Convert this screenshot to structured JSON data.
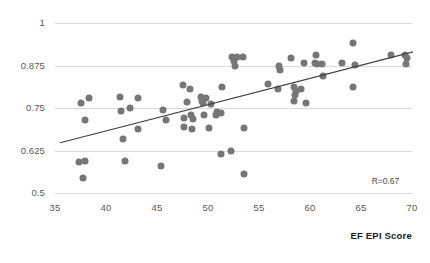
{
  "chart_data": {
    "type": "scatter",
    "title": "",
    "xlabel": "EF EPI Score",
    "ylabel": "",
    "xlim": [
      35,
      70
    ],
    "ylim": [
      0.5,
      1
    ],
    "xticks": [
      35,
      40,
      45,
      50,
      55,
      60,
      65,
      70
    ],
    "xtick_labels": [
      "35",
      "40",
      "45",
      "50",
      "55",
      "60",
      "65",
      "70"
    ],
    "yticks": [
      0.5,
      0.625,
      0.75,
      0.875,
      1
    ],
    "ytick_labels": [
      "0.5",
      "0.625",
      "0.75",
      "0.875",
      "1"
    ],
    "grid": "horizontal",
    "legend": "none",
    "annotations": [
      {
        "text": "R=0.67",
        "x": 68.2,
        "y": 0.533
      }
    ],
    "point_color": "#767676",
    "gridline_color": "#d9d9d9",
    "trend_line": {
      "color": "#404040",
      "x_start": 35.5,
      "y_start": 0.648,
      "x_end": 70.1,
      "y_end": 0.915
    },
    "points": [
      {
        "x": 37.5,
        "y": 0.766
      },
      {
        "x": 38.3,
        "y": 0.78
      },
      {
        "x": 37.9,
        "y": 0.714
      },
      {
        "x": 37.4,
        "y": 0.592
      },
      {
        "x": 37.9,
        "y": 0.594
      },
      {
        "x": 37.7,
        "y": 0.545
      },
      {
        "x": 41.4,
        "y": 0.782
      },
      {
        "x": 41.5,
        "y": 0.74
      },
      {
        "x": 42.4,
        "y": 0.75
      },
      {
        "x": 43.1,
        "y": 0.78
      },
      {
        "x": 43.1,
        "y": 0.688
      },
      {
        "x": 41.7,
        "y": 0.658
      },
      {
        "x": 41.9,
        "y": 0.594
      },
      {
        "x": 45.6,
        "y": 0.744
      },
      {
        "x": 45.9,
        "y": 0.716
      },
      {
        "x": 45.4,
        "y": 0.58
      },
      {
        "x": 47.5,
        "y": 0.818
      },
      {
        "x": 48.2,
        "y": 0.805
      },
      {
        "x": 47.9,
        "y": 0.768
      },
      {
        "x": 47.6,
        "y": 0.722
      },
      {
        "x": 47.6,
        "y": 0.694
      },
      {
        "x": 48.3,
        "y": 0.728
      },
      {
        "x": 48.5,
        "y": 0.718
      },
      {
        "x": 48.4,
        "y": 0.688
      },
      {
        "x": 49.3,
        "y": 0.782
      },
      {
        "x": 49.4,
        "y": 0.772
      },
      {
        "x": 49.5,
        "y": 0.765
      },
      {
        "x": 49.8,
        "y": 0.779
      },
      {
        "x": 49.6,
        "y": 0.728
      },
      {
        "x": 50.1,
        "y": 0.691
      },
      {
        "x": 50.3,
        "y": 0.762
      },
      {
        "x": 50.9,
        "y": 0.738
      },
      {
        "x": 51.3,
        "y": 0.735
      },
      {
        "x": 50.8,
        "y": 0.728
      },
      {
        "x": 51.4,
        "y": 0.812
      },
      {
        "x": 51.3,
        "y": 0.616
      },
      {
        "x": 52.3,
        "y": 0.625
      },
      {
        "x": 52.4,
        "y": 0.899
      },
      {
        "x": 52.5,
        "y": 0.889
      },
      {
        "x": 52.6,
        "y": 0.874
      },
      {
        "x": 52.8,
        "y": 0.9
      },
      {
        "x": 53.4,
        "y": 0.9
      },
      {
        "x": 53.5,
        "y": 0.691
      },
      {
        "x": 53.5,
        "y": 0.556
      },
      {
        "x": 55.9,
        "y": 0.821
      },
      {
        "x": 56.9,
        "y": 0.805
      },
      {
        "x": 57.0,
        "y": 0.874
      },
      {
        "x": 57.1,
        "y": 0.862
      },
      {
        "x": 58.1,
        "y": 0.898
      },
      {
        "x": 58.4,
        "y": 0.812
      },
      {
        "x": 58.6,
        "y": 0.8
      },
      {
        "x": 58.5,
        "y": 0.788
      },
      {
        "x": 58.4,
        "y": 0.772
      },
      {
        "x": 59.1,
        "y": 0.805
      },
      {
        "x": 59.4,
        "y": 0.882
      },
      {
        "x": 59.6,
        "y": 0.766
      },
      {
        "x": 60.5,
        "y": 0.882
      },
      {
        "x": 60.7,
        "y": 0.878
      },
      {
        "x": 60.6,
        "y": 0.905
      },
      {
        "x": 61.2,
        "y": 0.878
      },
      {
        "x": 61.3,
        "y": 0.845
      },
      {
        "x": 63.1,
        "y": 0.882
      },
      {
        "x": 64.2,
        "y": 0.94
      },
      {
        "x": 64.2,
        "y": 0.812
      },
      {
        "x": 64.4,
        "y": 0.876
      },
      {
        "x": 67.9,
        "y": 0.905
      },
      {
        "x": 69.3,
        "y": 0.906
      },
      {
        "x": 69.5,
        "y": 0.898
      },
      {
        "x": 69.4,
        "y": 0.88
      }
    ]
  }
}
